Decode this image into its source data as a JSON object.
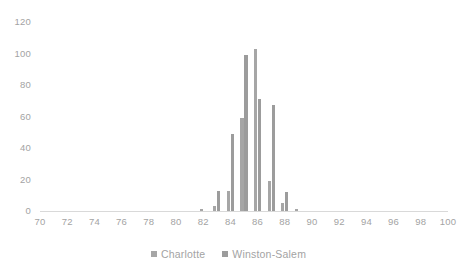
{
  "chart_data": {
    "type": "bar",
    "title": "",
    "subtitle": "",
    "xlabel": "",
    "ylabel": "",
    "xlim": [
      70,
      100
    ],
    "ylim": [
      0,
      120
    ],
    "xticks": [
      70,
      72,
      74,
      76,
      78,
      80,
      82,
      84,
      86,
      88,
      90,
      92,
      94,
      96,
      98,
      100
    ],
    "yticks": [
      0,
      20,
      40,
      60,
      80,
      100,
      120
    ],
    "grid": false,
    "legend_position": "bottom",
    "series": [
      {
        "name": "Charlotte",
        "color": "#a6a6a6",
        "x": [
          82.0,
          82.5,
          83.0,
          83.5,
          84.0,
          84.5,
          85.0,
          85.5,
          86.0,
          86.5,
          87.0,
          87.5,
          88.0,
          88.5,
          89.0
        ],
        "values": [
          1,
          0,
          3,
          0,
          13,
          0,
          59,
          0,
          103,
          0,
          19,
          0,
          5,
          0,
          1
        ]
      },
      {
        "name": "Winston-Salem",
        "color": "#9c9c9c",
        "x": [
          82.0,
          82.5,
          83.0,
          83.5,
          84.0,
          84.5,
          85.0,
          85.5,
          86.0,
          86.5,
          87.0,
          87.5,
          88.0,
          88.5,
          89.0
        ],
        "values": [
          0,
          0,
          13,
          0,
          49,
          0,
          99,
          0,
          71,
          0,
          67,
          0,
          12,
          0,
          0
        ]
      }
    ]
  },
  "legend": {
    "items": [
      {
        "label": "Charlotte",
        "color": "#a6a6a6"
      },
      {
        "label": "Winston-Salem",
        "color": "#9c9c9c"
      }
    ]
  },
  "axes": {
    "y_tick_labels": [
      "120",
      "100",
      "80",
      "60",
      "40",
      "20",
      "0"
    ],
    "x_tick_labels": [
      "70",
      "72",
      "74",
      "76",
      "78",
      "80",
      "82",
      "84",
      "86",
      "88",
      "90",
      "92",
      "94",
      "96",
      "98",
      "100"
    ]
  },
  "style": {
    "background": "#ffffff",
    "tick_label_color": "#a3a3a3",
    "axis_line_color": "#d9d9d9"
  }
}
